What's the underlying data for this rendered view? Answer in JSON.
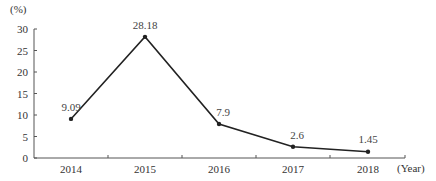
{
  "chart_data": {
    "type": "line",
    "title": "",
    "xlabel": "(Year)",
    "ylabel": "(%)",
    "categories": [
      "2014",
      "2015",
      "2016",
      "2017",
      "2018"
    ],
    "series": [
      {
        "name": "",
        "values": [
          9.09,
          28.18,
          7.9,
          2.6,
          1.45
        ]
      }
    ],
    "data_labels": [
      "9.09",
      "28.18",
      "7.9",
      "2.6",
      "1.45"
    ],
    "yticks": [
      "0",
      "5",
      "10",
      "15",
      "20",
      "25",
      "30"
    ],
    "ylim": [
      0,
      30
    ],
    "grid": false,
    "legend": "none",
    "colors": {
      "line": "#222222",
      "axis": "#555555"
    }
  }
}
